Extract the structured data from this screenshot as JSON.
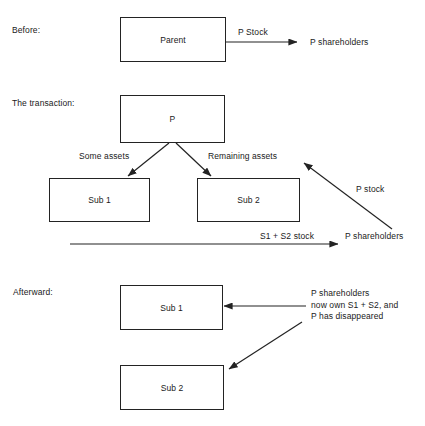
{
  "diagram": {
    "title_before": "Before:",
    "title_transaction": "The transaction:",
    "title_afterward": "Afterward:",
    "stroke_color": "#232323",
    "text_color": "#1a1a1a",
    "background_color": "#ffffff"
  },
  "before": {
    "parent_box_label": "Parent",
    "arrow_label": "P Stock",
    "target_label": "P shareholders"
  },
  "transaction": {
    "p_box_label": "P",
    "left_branch_label": "Some assets",
    "right_branch_label": "Remaining assets",
    "sub1_box_label": "Sub 1",
    "sub2_box_label": "Sub 2",
    "p_stock_label": "P stock",
    "bottom_arrow_label": "S1 + S2 stock",
    "bottom_target_label": "P shareholders"
  },
  "afterward": {
    "sub1_box_label": "Sub 1",
    "sub2_box_label": "Sub 2",
    "annotation_line1": "P shareholders",
    "annotation_line2": "now own S1 + S2, and",
    "annotation_line3": "P has disappeared"
  }
}
